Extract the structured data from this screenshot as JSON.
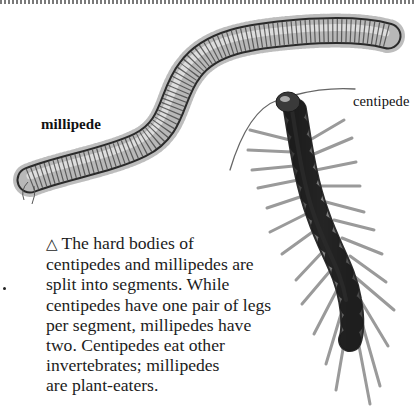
{
  "page": {
    "border": "dotted-top-rule",
    "labels": {
      "millipede": "millipede",
      "centipede": "centipede"
    },
    "caption": {
      "icon": "triangle-up-outline-icon",
      "icon_glyph": "△",
      "lines": [
        "The hard bodies of",
        "centipedes and millipedes are",
        "split into segments. While",
        "centipedes have one pair of legs",
        "per segment, millipedes have",
        "two. Centipedes eat other",
        "invertebrates; millipedes",
        "are plant-eaters."
      ]
    },
    "illustrations": [
      {
        "name": "millipede",
        "style": "grayscale engraving"
      },
      {
        "name": "centipede",
        "style": "grayscale engraving"
      }
    ]
  }
}
